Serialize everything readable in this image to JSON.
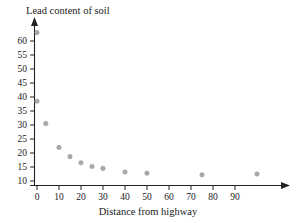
{
  "chart_data": {
    "type": "scatter",
    "title": "",
    "xlabel": "Distance from highway",
    "ylabel": "Lead content of soil",
    "xlim": [
      -4,
      112
    ],
    "ylim": [
      8,
      66
    ],
    "grid": false,
    "legend": null,
    "xticks": [
      0,
      10,
      20,
      30,
      40,
      50,
      60,
      70,
      80,
      90
    ],
    "yticks": [
      10,
      15,
      20,
      25,
      30,
      35,
      40,
      45,
      50,
      55,
      60
    ],
    "x": [
      0,
      0,
      4,
      10,
      15,
      20,
      25,
      30,
      40,
      50,
      75,
      100
    ],
    "y": [
      63,
      38.5,
      30.5,
      22,
      18.7,
      16.5,
      15.2,
      14.5,
      13.2,
      12.8,
      12.2,
      12.5
    ],
    "points": [
      {
        "x": 0,
        "y": 63
      },
      {
        "x": 0,
        "y": 38.5
      },
      {
        "x": 4,
        "y": 30.5
      },
      {
        "x": 10,
        "y": 22
      },
      {
        "x": 15,
        "y": 18.7
      },
      {
        "x": 20,
        "y": 16.5
      },
      {
        "x": 25,
        "y": 15.2
      },
      {
        "x": 30,
        "y": 14.5
      },
      {
        "x": 40,
        "y": 13.2
      },
      {
        "x": 50,
        "y": 12.8
      },
      {
        "x": 75,
        "y": 12.2
      },
      {
        "x": 100,
        "y": 12.5
      }
    ],
    "marker_color": "#a8a8a8",
    "axis_color": "#222222"
  },
  "axes": {
    "y_title": "Lead content of soil",
    "x_title": "Distance from highway"
  }
}
